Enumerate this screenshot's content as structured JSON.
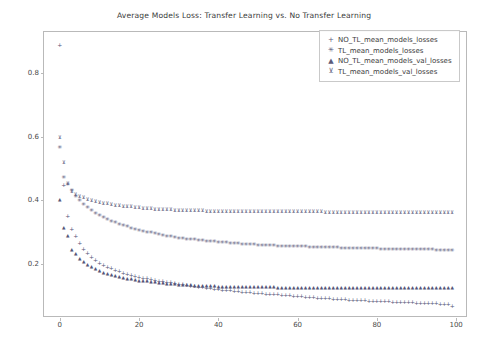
{
  "chart_data": {
    "type": "scatter",
    "title": "Average Models Loss: Transfer Learning vs. No Transfer Learning",
    "xlabel": "",
    "ylabel": "",
    "xlim": [
      -4,
      103
    ],
    "ylim": [
      0.03,
      0.93
    ],
    "grid": false,
    "legend_position": "upper right",
    "xticks": [
      0,
      20,
      40,
      60,
      80,
      100
    ],
    "yticks": [
      0.2,
      0.4,
      0.6,
      0.8
    ],
    "xtick_labels": [
      "0",
      "20",
      "40",
      "60",
      "80",
      "100"
    ],
    "ytick_labels": [
      "0.2",
      "0.4",
      "0.6",
      "0.8"
    ],
    "x": [
      0,
      1,
      2,
      3,
      4,
      5,
      6,
      7,
      8,
      9,
      10,
      11,
      12,
      13,
      14,
      15,
      16,
      17,
      18,
      19,
      20,
      21,
      22,
      23,
      24,
      25,
      26,
      27,
      28,
      29,
      30,
      31,
      32,
      33,
      34,
      35,
      36,
      37,
      38,
      39,
      40,
      41,
      42,
      43,
      44,
      45,
      46,
      47,
      48,
      49,
      50,
      51,
      52,
      53,
      54,
      55,
      56,
      57,
      58,
      59,
      60,
      61,
      62,
      63,
      64,
      65,
      66,
      67,
      68,
      69,
      70,
      71,
      72,
      73,
      74,
      75,
      76,
      77,
      78,
      79,
      80,
      81,
      82,
      83,
      84,
      85,
      86,
      87,
      88,
      89,
      90,
      91,
      92,
      93,
      94,
      95,
      96,
      97,
      98,
      99
    ],
    "series": [
      {
        "name": "NO_TL_mean_models_losses",
        "marker": "+",
        "values": [
          0.89,
          0.45,
          0.35,
          0.31,
          0.288,
          0.265,
          0.247,
          0.233,
          0.221,
          0.212,
          0.204,
          0.197,
          0.191,
          0.186,
          0.181,
          0.177,
          0.173,
          0.169,
          0.166,
          0.163,
          0.16,
          0.157,
          0.155,
          0.152,
          0.15,
          0.148,
          0.146,
          0.144,
          0.142,
          0.14,
          0.138,
          0.136,
          0.134,
          0.132,
          0.13,
          0.128,
          0.127,
          0.125,
          0.124,
          0.122,
          0.121,
          0.119,
          0.118,
          0.117,
          0.115,
          0.114,
          0.113,
          0.112,
          0.111,
          0.11,
          0.109,
          0.108,
          0.107,
          0.106,
          0.105,
          0.104,
          0.103,
          0.102,
          0.101,
          0.1,
          0.099,
          0.098,
          0.097,
          0.096,
          0.095,
          0.094,
          0.094,
          0.093,
          0.092,
          0.091,
          0.09,
          0.09,
          0.089,
          0.088,
          0.088,
          0.087,
          0.086,
          0.086,
          0.085,
          0.084,
          0.084,
          0.083,
          0.082,
          0.082,
          0.081,
          0.081,
          0.08,
          0.08,
          0.079,
          0.079,
          0.078,
          0.078,
          0.077,
          0.077,
          0.076,
          0.076,
          0.075,
          0.075,
          0.074,
          0.068
        ]
      },
      {
        "name": "TL_mean_models_losses",
        "marker": "*",
        "values": [
          0.565,
          0.47,
          0.448,
          0.43,
          0.412,
          0.398,
          0.386,
          0.375,
          0.366,
          0.358,
          0.35,
          0.344,
          0.338,
          0.333,
          0.328,
          0.323,
          0.319,
          0.315,
          0.311,
          0.308,
          0.304,
          0.301,
          0.298,
          0.296,
          0.293,
          0.291,
          0.288,
          0.286,
          0.284,
          0.282,
          0.28,
          0.279,
          0.277,
          0.276,
          0.274,
          0.273,
          0.271,
          0.27,
          0.269,
          0.268,
          0.267,
          0.266,
          0.265,
          0.264,
          0.263,
          0.262,
          0.261,
          0.261,
          0.26,
          0.259,
          0.258,
          0.258,
          0.257,
          0.256,
          0.256,
          0.255,
          0.255,
          0.254,
          0.254,
          0.253,
          0.253,
          0.252,
          0.252,
          0.251,
          0.251,
          0.25,
          0.25,
          0.25,
          0.249,
          0.249,
          0.249,
          0.248,
          0.248,
          0.248,
          0.247,
          0.247,
          0.247,
          0.246,
          0.246,
          0.246,
          0.246,
          0.245,
          0.245,
          0.245,
          0.245,
          0.244,
          0.244,
          0.244,
          0.244,
          0.244,
          0.243,
          0.243,
          0.243,
          0.243,
          0.243,
          0.242,
          0.242,
          0.242,
          0.242,
          0.242
        ]
      },
      {
        "name": "NO_TL_mean_models_val_losses",
        "marker": "triangle-up",
        "values": [
          0.4,
          0.312,
          0.288,
          0.244,
          0.232,
          0.215,
          0.205,
          0.197,
          0.19,
          0.184,
          0.178,
          0.173,
          0.169,
          0.165,
          0.162,
          0.159,
          0.156,
          0.154,
          0.152,
          0.15,
          0.148,
          0.146,
          0.145,
          0.143,
          0.142,
          0.141,
          0.14,
          0.138,
          0.137,
          0.136,
          0.135,
          0.134,
          0.134,
          0.133,
          0.132,
          0.132,
          0.131,
          0.131,
          0.13,
          0.13,
          0.129,
          0.129,
          0.129,
          0.128,
          0.128,
          0.128,
          0.127,
          0.127,
          0.127,
          0.127,
          0.126,
          0.126,
          0.126,
          0.126,
          0.126,
          0.125,
          0.125,
          0.125,
          0.125,
          0.125,
          0.125,
          0.125,
          0.124,
          0.124,
          0.124,
          0.124,
          0.124,
          0.124,
          0.124,
          0.124,
          0.124,
          0.124,
          0.124,
          0.124,
          0.124,
          0.124,
          0.124,
          0.124,
          0.124,
          0.124,
          0.124,
          0.124,
          0.124,
          0.124,
          0.124,
          0.124,
          0.124,
          0.124,
          0.124,
          0.124,
          0.124,
          0.124,
          0.124,
          0.124,
          0.124,
          0.124,
          0.124,
          0.124,
          0.124,
          0.124
        ]
      },
      {
        "name": "TL_mean_models_val_losses",
        "marker": "tri-down",
        "values": [
          0.6,
          0.522,
          0.455,
          0.43,
          0.42,
          0.415,
          0.41,
          0.405,
          0.401,
          0.398,
          0.395,
          0.393,
          0.391,
          0.389,
          0.387,
          0.385,
          0.384,
          0.382,
          0.381,
          0.38,
          0.378,
          0.377,
          0.376,
          0.375,
          0.374,
          0.374,
          0.373,
          0.372,
          0.372,
          0.371,
          0.371,
          0.37,
          0.37,
          0.37,
          0.369,
          0.369,
          0.369,
          0.368,
          0.368,
          0.368,
          0.368,
          0.368,
          0.367,
          0.367,
          0.367,
          0.367,
          0.367,
          0.367,
          0.367,
          0.367,
          0.366,
          0.366,
          0.366,
          0.366,
          0.366,
          0.366,
          0.366,
          0.366,
          0.366,
          0.366,
          0.366,
          0.366,
          0.366,
          0.366,
          0.366,
          0.366,
          0.366,
          0.365,
          0.365,
          0.365,
          0.365,
          0.365,
          0.365,
          0.365,
          0.365,
          0.365,
          0.365,
          0.365,
          0.365,
          0.365,
          0.365,
          0.365,
          0.365,
          0.365,
          0.365,
          0.365,
          0.365,
          0.365,
          0.365,
          0.365,
          0.365,
          0.365,
          0.365,
          0.365,
          0.365,
          0.365,
          0.365,
          0.365,
          0.365,
          0.363
        ]
      }
    ]
  },
  "legend": {
    "entries": [
      {
        "marker": "+",
        "label": "NO_TL_mean_models_losses"
      },
      {
        "marker": "✳",
        "label": "TL_mean_models_losses"
      },
      {
        "marker": "▲",
        "label": "NO_TL_mean_models_val_losses"
      },
      {
        "marker": "⊻",
        "label": "TL_mean_models_val_losses"
      }
    ]
  },
  "colors": {
    "marker": "#555577",
    "axis": "#b9b9b9",
    "text": "#3b3b3b",
    "background": "#ffffff"
  }
}
